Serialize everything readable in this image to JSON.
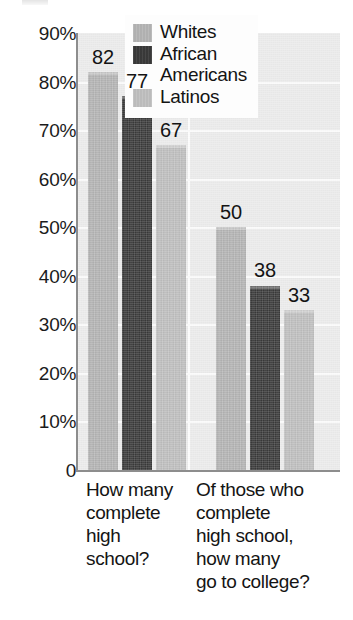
{
  "chart_data": {
    "type": "bar",
    "title": "",
    "subtitle": "",
    "xlabel": "",
    "ylabel": "",
    "ylim": [
      0,
      90
    ],
    "grid": true,
    "legend_position": "top-right",
    "y_ticks": [
      {
        "value": 90,
        "label": "90%"
      },
      {
        "value": 80,
        "label": "80%"
      },
      {
        "value": 70,
        "label": "70%"
      },
      {
        "value": 60,
        "label": "60%"
      },
      {
        "value": 50,
        "label": "50%"
      },
      {
        "value": 40,
        "label": "40%"
      },
      {
        "value": 30,
        "label": "30%"
      },
      {
        "value": 20,
        "label": "20%"
      },
      {
        "value": 10,
        "label": "10%"
      },
      {
        "value": 0,
        "label": "0"
      }
    ],
    "categories": [
      "How many complete high school?",
      "Of those who complete high school, how many go to college?"
    ],
    "category_labels_wrapped": [
      "How many\ncomplete\nhigh\nschool?",
      "Of those who\ncomplete\nhigh school,\nhow many\ngo to college?"
    ],
    "series": [
      {
        "name": "Whites",
        "color": "#b5b5b5",
        "values": [
          82,
          77
        ]
      },
      {
        "name": "African Americans",
        "color": "#3a3a3a",
        "values": [
          77,
          38
        ]
      },
      {
        "name": "Latinos",
        "color": "#c0c0c0",
        "values": [
          67,
          33
        ]
      }
    ],
    "bars": [
      {
        "group": 0,
        "series": "Whites",
        "value": 82,
        "label": "82",
        "color": "#b5b5b5"
      },
      {
        "group": 0,
        "series": "African Americans",
        "value": 77,
        "label": "77",
        "color": "#3a3a3a"
      },
      {
        "group": 0,
        "series": "Latinos",
        "value": 67,
        "label": "67",
        "color": "#c0c0c0"
      },
      {
        "group": 1,
        "series": "Whites",
        "value": 50,
        "label": "50",
        "color": "#b5b5b5"
      },
      {
        "group": 1,
        "series": "African Americans",
        "value": 38,
        "label": "38",
        "color": "#3a3a3a"
      },
      {
        "group": 1,
        "series": "Latinos",
        "value": 33,
        "label": "33",
        "color": "#c0c0c0"
      }
    ],
    "legend": [
      {
        "label": "Whites",
        "label_wrapped": "Whites",
        "color": "#b5b5b5"
      },
      {
        "label": "African Americans",
        "label_wrapped": "African\nAmericans",
        "color": "#3a3a3a"
      },
      {
        "label": "Latinos",
        "label_wrapped": "Latinos",
        "color": "#c0c0c0"
      }
    ],
    "colors": {
      "plot_background": "#ebebeb",
      "gridline": "#fbfbfb",
      "axis": "#8d8d8d",
      "legend_background": "#fdfdfd",
      "text": "#141414"
    }
  }
}
